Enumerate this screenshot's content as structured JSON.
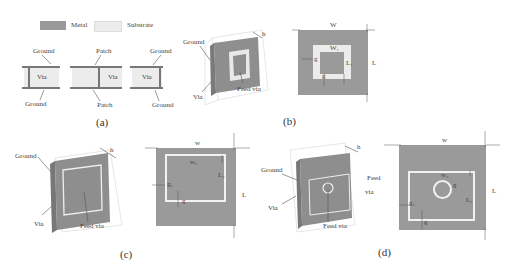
{
  "legend": {
    "metal_label": "Metal",
    "substrate_label": "Substrate",
    "metal_color": "#9a9a9a",
    "substrate_color": "#ececec"
  },
  "panel_a": {
    "caption": "(a)",
    "cells": [
      {
        "top": "Ground",
        "center": "Via",
        "bottom": "Ground"
      },
      {
        "top": "Patch",
        "center": "Via",
        "bottom": "Patch"
      },
      {
        "top": "Ground",
        "center": "Via",
        "bottom": "Ground"
      }
    ]
  },
  "panel_b": {
    "caption": "(b)",
    "iso": {
      "ground": "Ground",
      "via": "Via",
      "feed_via": "Feed via",
      "h": "h"
    },
    "top": {
      "W": "W",
      "L": "L",
      "W1": "W₁",
      "L1": "L₁",
      "g1": "g",
      "g2": "g"
    }
  },
  "panel_c": {
    "caption": "(c)",
    "iso": {
      "ground": "Ground",
      "via": "Via",
      "feed_via": "Feed via",
      "h": "h"
    },
    "top": {
      "W": "w",
      "L": "L",
      "W2": "w₂",
      "L2": "L₂",
      "g1": "g₂",
      "g2": "g"
    }
  },
  "panel_d": {
    "caption": "(d)",
    "iso": {
      "ground": "Ground",
      "via": "Via",
      "feed_via": "Feed via",
      "feed_via_side": "Feed",
      "via_side": "via",
      "h": "h"
    },
    "top": {
      "W": "w",
      "L": "L",
      "W2": "w₂",
      "L2": "L₂",
      "g1": "g₂",
      "g2": "g",
      "gr": "g"
    }
  }
}
